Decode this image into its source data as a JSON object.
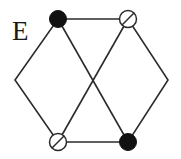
{
  "figure": {
    "label": "E",
    "label_position": {
      "x": 12,
      "y": 40
    },
    "shape": "hexagon",
    "background_color": "#ffffff",
    "stroke_color": "#2b2b2b",
    "stroke_width": 1.6,
    "fill_color": "#ffffff",
    "node_radius": 8.5,
    "node_filled_color": "#111111",
    "node_open_color": "#ffffff",
    "vertices": [
      {
        "id": "top-left",
        "x": 58,
        "y": 19,
        "marker": "filled-circle"
      },
      {
        "id": "top-right",
        "x": 128,
        "y": 19,
        "marker": "slashed-circle"
      },
      {
        "id": "right",
        "x": 168,
        "y": 80,
        "marker": "none"
      },
      {
        "id": "bottom-right",
        "x": 128,
        "y": 142,
        "marker": "filled-circle"
      },
      {
        "id": "bottom-left",
        "x": 58,
        "y": 142,
        "marker": "slashed-circle"
      },
      {
        "id": "left",
        "x": 15,
        "y": 80,
        "marker": "none"
      }
    ],
    "perimeter_edges": [
      {
        "from": "top-left",
        "to": "top-right"
      },
      {
        "from": "top-right",
        "to": "right"
      },
      {
        "from": "right",
        "to": "bottom-right"
      },
      {
        "from": "bottom-right",
        "to": "bottom-left"
      },
      {
        "from": "bottom-left",
        "to": "left"
      },
      {
        "from": "left",
        "to": "top-left"
      }
    ],
    "diagonal_edges": [
      {
        "from": "top-left",
        "to": "bottom-right"
      },
      {
        "from": "top-right",
        "to": "bottom-left"
      }
    ],
    "slash_angle_description": "upper-right to lower-left"
  }
}
